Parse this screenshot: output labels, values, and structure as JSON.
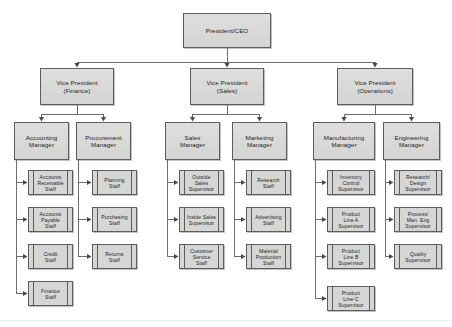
{
  "diagram": {
    "type": "organizational-chart",
    "colors": {
      "node_fill": "#d9d9d9",
      "node_border": "#5d5d5d",
      "connector": "#6e6e6e",
      "arrowhead": "#4a4a4a",
      "background": "#ffffff",
      "text": "#1d1d1d"
    },
    "root": {
      "id": "president-ceo",
      "label": "President/CEO",
      "shape": "rect",
      "x": 183,
      "y": 13,
      "w": 88,
      "h": 35
    },
    "vice_presidents": [
      {
        "id": "vp-finance",
        "label": "Vice President\n(Finance)",
        "shape": "rect",
        "x": 40,
        "y": 68,
        "w": 74,
        "h": 37
      },
      {
        "id": "vp-sales",
        "label": "Vice President\n(Sales)",
        "shape": "rect",
        "x": 190,
        "y": 68,
        "w": 74,
        "h": 37
      },
      {
        "id": "vp-operations",
        "label": "Vice President\n(Operations)",
        "shape": "rect",
        "x": 337,
        "y": 68,
        "w": 76,
        "h": 37
      }
    ],
    "managers": [
      {
        "id": "accounting-manager",
        "label": "Accounting\nManager",
        "shape": "rect",
        "x": 14,
        "y": 122,
        "w": 55,
        "h": 38,
        "parent": "vp-finance"
      },
      {
        "id": "procurement-manager",
        "label": "Procurement\nManager",
        "shape": "rect",
        "x": 76,
        "y": 122,
        "w": 55,
        "h": 38,
        "parent": "vp-finance"
      },
      {
        "id": "sales-manager",
        "label": "Sales\nManager",
        "shape": "rect",
        "x": 165,
        "y": 122,
        "w": 55,
        "h": 38,
        "parent": "vp-sales"
      },
      {
        "id": "marketing-manager",
        "label": "Marketing\nManager",
        "shape": "rect",
        "x": 232,
        "y": 122,
        "w": 55,
        "h": 38,
        "parent": "vp-sales"
      },
      {
        "id": "manufacturing-manager",
        "label": "Manufacturing\nManager",
        "shape": "rect",
        "x": 313,
        "y": 122,
        "w": 62,
        "h": 38,
        "parent": "vp-operations"
      },
      {
        "id": "engineering-manager",
        "label": "Engineering\nManager",
        "shape": "rect",
        "x": 383,
        "y": 122,
        "w": 57,
        "h": 38,
        "parent": "vp-operations"
      }
    ],
    "staff": [
      {
        "id": "accounts-receivable-staff",
        "label": "Accounts\nReceivable\nStaff",
        "shape": "process",
        "x": 28,
        "y": 170,
        "w": 45,
        "h": 25,
        "parent": "accounting-manager"
      },
      {
        "id": "accounts-payable-staff",
        "label": "Accounts\nPayable\nStaff",
        "shape": "process",
        "x": 28,
        "y": 207,
        "w": 45,
        "h": 25,
        "parent": "accounting-manager"
      },
      {
        "id": "credit-staff",
        "label": "Credit\nStaff",
        "shape": "process",
        "x": 28,
        "y": 244,
        "w": 45,
        "h": 25,
        "parent": "accounting-manager"
      },
      {
        "id": "finance-staff",
        "label": "Finance\nStaff",
        "shape": "process",
        "x": 28,
        "y": 281,
        "w": 45,
        "h": 25,
        "parent": "accounting-manager"
      },
      {
        "id": "planning-staff",
        "label": "Planning\nStaff",
        "shape": "process",
        "x": 92,
        "y": 170,
        "w": 45,
        "h": 25,
        "parent": "procurement-manager"
      },
      {
        "id": "purchasing-staff",
        "label": "Purchasing\nStaff",
        "shape": "process",
        "x": 92,
        "y": 207,
        "w": 45,
        "h": 25,
        "parent": "procurement-manager"
      },
      {
        "id": "returns-staff",
        "label": "Returns\nStaff",
        "shape": "process",
        "x": 92,
        "y": 244,
        "w": 45,
        "h": 25,
        "parent": "procurement-manager"
      },
      {
        "id": "outside-sales-supervisor",
        "label": "Outside\nSales\nSupervisor",
        "shape": "process",
        "x": 179,
        "y": 170,
        "w": 45,
        "h": 25,
        "parent": "sales-manager"
      },
      {
        "id": "inside-sales-supervisor",
        "label": "Inside Sales\nSupervisor",
        "shape": "process",
        "x": 179,
        "y": 207,
        "w": 45,
        "h": 25,
        "parent": "sales-manager"
      },
      {
        "id": "customer-service-staff",
        "label": "Customer\nService\nStaff",
        "shape": "process",
        "x": 179,
        "y": 244,
        "w": 45,
        "h": 25,
        "parent": "sales-manager"
      },
      {
        "id": "research-staff",
        "label": "Research\nStaff",
        "shape": "process",
        "x": 246,
        "y": 170,
        "w": 45,
        "h": 25,
        "parent": "marketing-manager"
      },
      {
        "id": "advertising-staff",
        "label": "Advertising\nStaff",
        "shape": "process",
        "x": 246,
        "y": 207,
        "w": 45,
        "h": 25,
        "parent": "marketing-manager"
      },
      {
        "id": "material-production-staff",
        "label": "Material\nProduction\nStaff",
        "shape": "process",
        "x": 246,
        "y": 244,
        "w": 45,
        "h": 25,
        "parent": "marketing-manager"
      },
      {
        "id": "inventory-control-supervisor",
        "label": "Inventory\nControl\nSupervisor",
        "shape": "process",
        "x": 327,
        "y": 170,
        "w": 48,
        "h": 25,
        "parent": "manufacturing-manager"
      },
      {
        "id": "product-line-a-supervisor",
        "label": "Product\nLine A\nSupervisor",
        "shape": "process",
        "x": 327,
        "y": 207,
        "w": 48,
        "h": 25,
        "parent": "manufacturing-manager"
      },
      {
        "id": "product-line-b-supervisor",
        "label": "Product\nLine B\nSupervisor",
        "shape": "process",
        "x": 327,
        "y": 244,
        "w": 48,
        "h": 25,
        "parent": "manufacturing-manager"
      },
      {
        "id": "product-line-c-supervisor",
        "label": "Product\nLine C\nSupervisor",
        "shape": "process",
        "x": 327,
        "y": 286,
        "w": 48,
        "h": 25,
        "parent": "manufacturing-manager"
      },
      {
        "id": "research-design-supervisor",
        "label": "Research/\nDesign\nSupervisor",
        "shape": "process",
        "x": 394,
        "y": 170,
        "w": 48,
        "h": 25,
        "parent": "engineering-manager"
      },
      {
        "id": "process-man-eng-supervisor",
        "label": "Process/\nMan. Eng\nSupervisor",
        "shape": "process",
        "x": 394,
        "y": 207,
        "w": 48,
        "h": 25,
        "parent": "engineering-manager"
      },
      {
        "id": "quality-supervisor",
        "label": "Quality\nSupervisor",
        "shape": "process",
        "x": 394,
        "y": 244,
        "w": 48,
        "h": 25,
        "parent": "engineering-manager"
      }
    ]
  }
}
